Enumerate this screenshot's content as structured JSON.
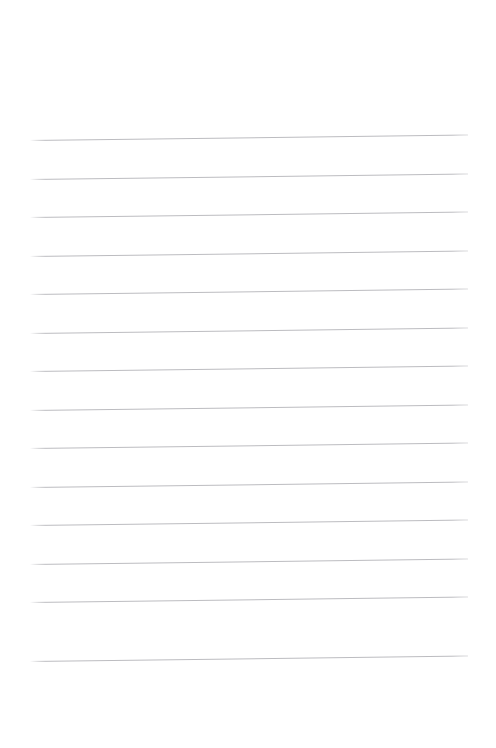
{
  "document": {
    "kind": "lined-paper-page",
    "title": "Lined Paper Page",
    "page_width": 496,
    "page_height": 748,
    "background_color": "#ffffff",
    "content_text": "",
    "is_blank": "true"
  },
  "paper": {
    "surface_label": "paper-surface",
    "top_margin_label": "top margin",
    "bottom_margin_label": "bottom margin",
    "left_margin_label": "left margin",
    "right_margin_label": "right margin",
    "top_margin_px": 135,
    "bottom_margin_px": 83,
    "left_margin_px": 30,
    "right_margin_px": 28
  },
  "rules": {
    "group_label": "ruled lines",
    "count": 14,
    "color": "#bcbcc0",
    "thickness_px": 1,
    "spacing_px": 38.5,
    "left_x": 30,
    "right_x": 468,
    "length_px": 438,
    "tilt_degrees": -0.72,
    "lines": [
      {
        "index": 1,
        "label": "rule-line-1",
        "y_left": 140.0,
        "y_right": 134.5
      },
      {
        "index": 2,
        "label": "rule-line-2",
        "y_left": 178.5,
        "y_right": 173.0
      },
      {
        "index": 3,
        "label": "rule-line-3",
        "y_left": 217.0,
        "y_right": 211.5
      },
      {
        "index": 4,
        "label": "rule-line-4",
        "y_left": 255.5,
        "y_right": 250.0
      },
      {
        "index": 5,
        "label": "rule-line-5",
        "y_left": 294.0,
        "y_right": 288.5
      },
      {
        "index": 6,
        "label": "rule-line-6",
        "y_left": 332.5,
        "y_right": 327.0
      },
      {
        "index": 7,
        "label": "rule-line-7",
        "y_left": 371.0,
        "y_right": 365.5
      },
      {
        "index": 8,
        "label": "rule-line-8",
        "y_left": 409.5,
        "y_right": 404.0
      },
      {
        "index": 9,
        "label": "rule-line-9",
        "y_left": 448.0,
        "y_right": 442.5
      },
      {
        "index": 10,
        "label": "rule-line-10",
        "y_left": 486.5,
        "y_right": 481.0
      },
      {
        "index": 11,
        "label": "rule-line-11",
        "y_left": 525.0,
        "y_right": 519.5
      },
      {
        "index": 12,
        "label": "rule-line-12",
        "y_left": 563.5,
        "y_right": 558.0
      },
      {
        "index": 13,
        "label": "rule-line-13",
        "y_left": 602.0,
        "y_right": 596.5
      },
      {
        "index": 14,
        "label": "rule-line-14",
        "y_left": 660.5,
        "y_right": 655.0
      }
    ]
  },
  "writing_slots": {
    "group_label": "writing lines",
    "count": 14,
    "placeholder": ""
  }
}
